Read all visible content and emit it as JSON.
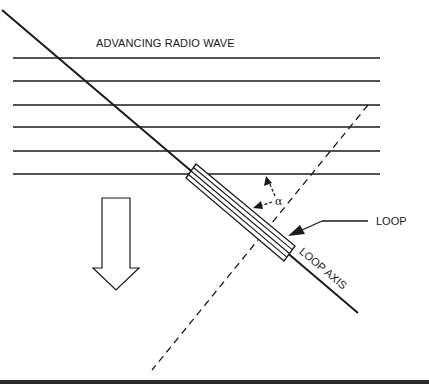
{
  "figure": {
    "title": "ADVANCING RADIO WAVE",
    "labels": {
      "loop": "LOOP",
      "loop_axis": "LOOP AXIS",
      "angle": "α"
    },
    "wave_fronts": {
      "count": 6,
      "y_positions": [
        58,
        81,
        105,
        127,
        151,
        174
      ]
    },
    "colors": {
      "line": "#1a1a1a",
      "background": "#ffffff"
    }
  }
}
